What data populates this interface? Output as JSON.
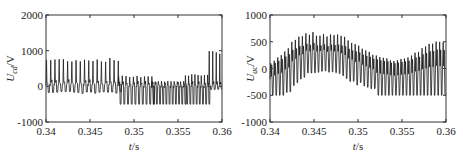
{
  "chart_data": [
    {
      "type": "line",
      "id": "left",
      "title": "",
      "xlabel": "t/s",
      "ylabel": "U_cd/V",
      "ylabel_main": "U",
      "ylabel_sub": "cd",
      "ylabel_unit": "/V",
      "xlim": [
        0.34,
        0.36
      ],
      "ylim": [
        -1000,
        2000
      ],
      "xticks": [
        0.34,
        0.345,
        0.35,
        0.355,
        0.36
      ],
      "xtick_labels": [
        "0.34",
        "0.345",
        "0.35",
        "0.355",
        "0.36"
      ],
      "yticks": [
        -1000,
        0,
        1000,
        2000
      ],
      "ytick_labels": [
        "-1000",
        "0",
        "1000",
        "2000"
      ],
      "grid": false,
      "legend": null,
      "description": "Dense switching waveform: pulses peaking ~800 V for t<0.348 s, then clamped at ~-500 V with small positive peaks (~300 V) until ~0.3585 s, then rising spikes to ~1000 V near 0.36 s",
      "series": [
        {
          "name": "U_cd",
          "segments": [
            {
              "t_start": 0.34,
              "t_end": 0.3482,
              "period": 0.00048,
              "peak": 800,
              "trough": -200,
              "baseline": 50
            },
            {
              "t_start": 0.3482,
              "t_end": 0.352,
              "period": 0.00042,
              "peak": 300,
              "trough": -500,
              "baseline": 0
            },
            {
              "t_start": 0.352,
              "t_end": 0.3558,
              "period": 0.00036,
              "peak": 150,
              "trough": -500,
              "baseline": 0
            },
            {
              "t_start": 0.3558,
              "t_end": 0.3585,
              "period": 0.00036,
              "peak": 350,
              "trough": -500,
              "baseline": 0
            },
            {
              "t_start": 0.3585,
              "t_end": 0.36,
              "period": 0.0004,
              "peak": 1000,
              "trough": -100,
              "baseline": 0
            }
          ]
        }
      ]
    },
    {
      "type": "line",
      "id": "right",
      "title": "",
      "xlabel": "t/s",
      "ylabel": "U_ac/V",
      "ylabel_main": "U",
      "ylabel_sub": "ac",
      "ylabel_unit": "/V",
      "xlim": [
        0.34,
        0.36
      ],
      "ylim": [
        -1000,
        1000
      ],
      "xticks": [
        0.34,
        0.345,
        0.35,
        0.355,
        0.36
      ],
      "xtick_labels": [
        "0.34",
        "0.345",
        "0.35",
        "0.355",
        "0.36"
      ],
      "yticks": [
        -1000,
        -500,
        0,
        500,
        1000
      ],
      "ytick_labels": [
        "-1000",
        "-500",
        "0",
        "500",
        "1000"
      ],
      "grid": false,
      "legend": null,
      "description": "Dense oscillation with envelope rising from ~0 to peaks ~650-700 V around 0.344-0.348 s, then declining; after ~0.352 s troughs clamp at -500 V and peaks rise again to ~550 V near 0.36 s",
      "series": [
        {
          "name": "U_ac",
          "envelope": [
            {
              "t": 0.34,
              "peak": 100,
              "trough": -500
            },
            {
              "t": 0.3415,
              "peak": 300,
              "trough": -500
            },
            {
              "t": 0.3425,
              "peak": 550,
              "trough": -300
            },
            {
              "t": 0.344,
              "peak": 680,
              "trough": -100
            },
            {
              "t": 0.346,
              "peak": 680,
              "trough": -50
            },
            {
              "t": 0.3475,
              "peak": 670,
              "trough": -100
            },
            {
              "t": 0.349,
              "peak": 550,
              "trough": -250
            },
            {
              "t": 0.3505,
              "peak": 400,
              "trough": -350
            },
            {
              "t": 0.352,
              "peak": 250,
              "trough": -500
            },
            {
              "t": 0.354,
              "peak": 150,
              "trough": -500
            },
            {
              "t": 0.356,
              "peak": 250,
              "trough": -500
            },
            {
              "t": 0.358,
              "peak": 500,
              "trough": -500
            },
            {
              "t": 0.36,
              "peak": 550,
              "trough": -500
            }
          ],
          "period": 0.0004
        }
      ]
    }
  ],
  "layout": {
    "plots": [
      {
        "left": 46,
        "top": 15,
        "right": 222,
        "bottom": 122
      },
      {
        "left": 270,
        "top": 15,
        "right": 446,
        "bottom": 122
      }
    ],
    "line_color": "#1a1a1a",
    "axis_color": "#333333"
  }
}
